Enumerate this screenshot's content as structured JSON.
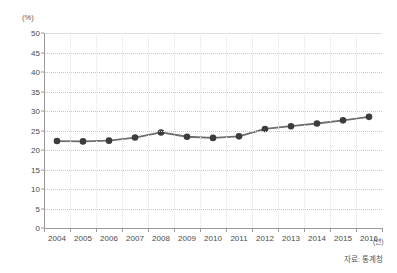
{
  "chart_data": {
    "type": "line",
    "title": "",
    "subtitle": "",
    "xlabel": "(년)",
    "ylabel": "(%)",
    "categories": [
      "2004",
      "2005",
      "2006",
      "2007",
      "2008",
      "2009",
      "2010",
      "2011",
      "2012",
      "2013",
      "2014",
      "2015",
      "2016"
    ],
    "x": [
      2004,
      2005,
      2006,
      2007,
      2008,
      2009,
      2010,
      2011,
      2012,
      2013,
      2014,
      2015,
      2016
    ],
    "values": [
      22.3,
      22.2,
      22.4,
      23.2,
      24.5,
      23.4,
      23.1,
      23.5,
      25.4,
      26.1,
      26.8,
      27.6,
      28.5
    ],
    "series": [
      {
        "name": "",
        "values": [
          22.3,
          22.2,
          22.4,
          23.2,
          24.5,
          23.4,
          23.1,
          23.5,
          25.4,
          26.1,
          26.8,
          27.6,
          28.5
        ]
      }
    ],
    "ylim": [
      0,
      50
    ],
    "ytick_labels": [
      "0",
      "5",
      "10",
      "15",
      "20",
      "25",
      "30",
      "35",
      "40",
      "45",
      "50"
    ],
    "ytick_values": [
      0,
      5,
      10,
      15,
      20,
      25,
      30,
      35,
      40,
      45,
      50
    ],
    "grid": true,
    "grid_axis": "y",
    "legend": false,
    "legend_position": "none",
    "marker": "circle",
    "annotations": []
  },
  "axes": {
    "y_unit_label": "(%)",
    "x_unit_label": "(년)"
  },
  "footer": {
    "source_note": "자료: 통계청"
  },
  "colors": {
    "line": "#6e6e6e",
    "marker": "#3c3c3c",
    "grid": "#c9c9c9",
    "axis": "#9a9a9a",
    "text": "#4a4a4a",
    "background": "#ffffff"
  }
}
